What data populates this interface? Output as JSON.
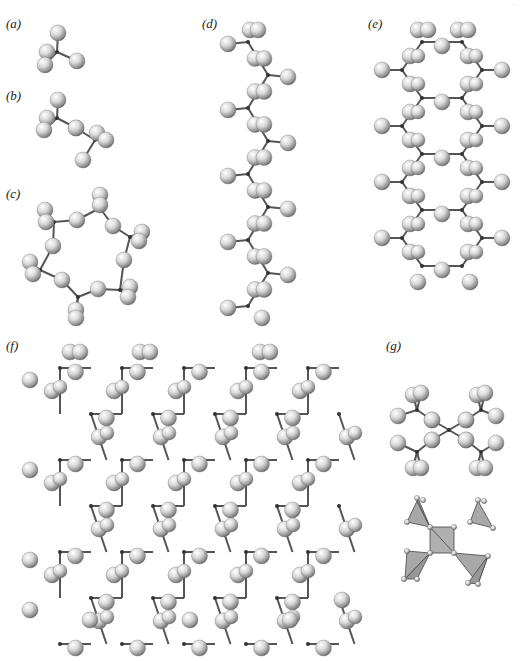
{
  "header": {
    "cropped_text": "—"
  },
  "panels": [
    {
      "id": "a",
      "label": "(a)",
      "x": 6,
      "y": 16,
      "description": "single SiO4 tetrahedron"
    },
    {
      "id": "b",
      "label": "(b)",
      "x": 6,
      "y": 88,
      "description": "paired tetrahedra (Si2O7)"
    },
    {
      "id": "c",
      "label": "(c)",
      "x": 6,
      "y": 186,
      "description": "six-membered ring"
    },
    {
      "id": "d",
      "label": "(d)",
      "x": 202,
      "y": 16,
      "description": "single chain"
    },
    {
      "id": "e",
      "label": "(e)",
      "x": 368,
      "y": 16,
      "description": "double chain"
    },
    {
      "id": "f",
      "label": "(f)",
      "x": 6,
      "y": 338,
      "description": "sheet structure"
    },
    {
      "id": "g",
      "label": "(g)",
      "x": 386,
      "y": 338,
      "description": "ball-and-stick and polyhedral representation"
    }
  ],
  "colors": {
    "sphere_light": "#ffffff",
    "sphere_mid": "#cfcfcf",
    "sphere_dark": "#6a6a6a",
    "bond": "#555555",
    "polyhedron": "#a8a8a8",
    "text": "#222222"
  }
}
